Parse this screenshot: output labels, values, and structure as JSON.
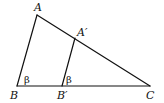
{
  "diagram": {
    "type": "similar-triangles",
    "colors": {
      "line": "#111111",
      "background": "#ffffff"
    },
    "points": {
      "A": {
        "label": "A",
        "x": 37,
        "y": 15
      },
      "B": {
        "label": "B",
        "x": 17,
        "y": 86
      },
      "C": {
        "label": "C",
        "x": 150,
        "y": 86
      },
      "A'": {
        "label": "A′",
        "x": 75,
        "y": 38
      },
      "B'": {
        "label": "B′",
        "x": 62,
        "y": 86
      }
    },
    "segments": [
      [
        "A",
        "B"
      ],
      [
        "A",
        "C"
      ],
      [
        "B",
        "C"
      ],
      [
        "A'",
        "B'"
      ]
    ],
    "angles": [
      {
        "at": "B",
        "label": "β"
      },
      {
        "at": "B'",
        "label": "β"
      }
    ],
    "labels": {
      "A": "A",
      "B": "B",
      "C": "C",
      "A_prime": "A′",
      "B_prime": "B′",
      "angle_B": "β",
      "angle_B_prime": "β"
    }
  }
}
